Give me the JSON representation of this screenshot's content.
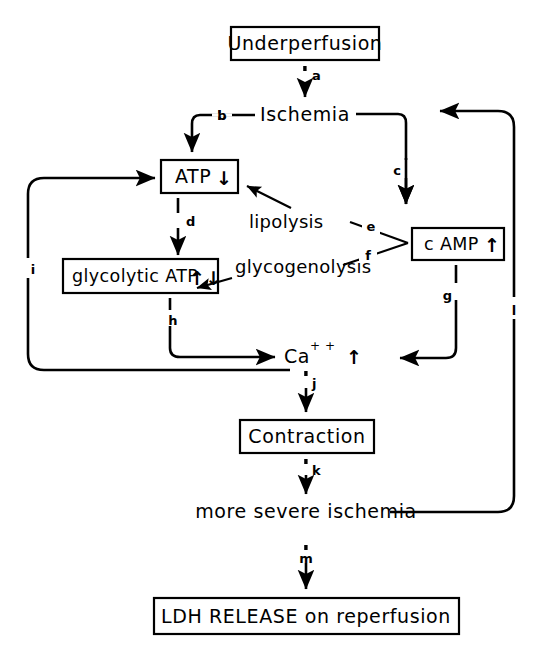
{
  "figure": {
    "type": "flow-diagram",
    "title_visible": false,
    "background_color": "#ffffff",
    "stroke_color": "#000000"
  },
  "nodes": [
    {
      "id": "underperfusion",
      "label": "Underperfusion",
      "shape": "box"
    },
    {
      "id": "ischemia",
      "label": "Ischemia",
      "shape": "plain"
    },
    {
      "id": "atp",
      "label": "ATP",
      "arrow_glyph": "↓",
      "shape": "box"
    },
    {
      "id": "glycolytic_atp",
      "label": "glycolytic  ATP",
      "arrow_glyph": "↑↓",
      "shape": "box"
    },
    {
      "id": "lipolysis",
      "label": "lipolysis",
      "shape": "plain"
    },
    {
      "id": "glycogenolysis",
      "label": "glycogenolysis",
      "shape": "plain"
    },
    {
      "id": "camp",
      "label": "c AMP",
      "arrow_glyph": "↑",
      "shape": "box"
    },
    {
      "id": "calcium",
      "label": "Ca",
      "superscript": "+ +",
      "arrow_glyph": "↑",
      "shape": "plain"
    },
    {
      "id": "contraction",
      "label": "Contraction",
      "shape": "box"
    },
    {
      "id": "more_severe_ischemia",
      "label": "more severe ischemia",
      "shape": "plain"
    },
    {
      "id": "ldh_release",
      "label": "LDH RELEASE on reperfusion",
      "shape": "box"
    }
  ],
  "edges": [
    {
      "id": "a",
      "label": "a",
      "from": "underperfusion",
      "to": "ischemia"
    },
    {
      "id": "b",
      "label": "b",
      "from": "ischemia",
      "to": "atp"
    },
    {
      "id": "c",
      "label": "c",
      "from": "ischemia",
      "to": "camp"
    },
    {
      "id": "d",
      "label": "d",
      "from": "atp",
      "to": "glycolytic_atp"
    },
    {
      "id": "e",
      "label": "e",
      "from": "camp",
      "to": "lipolysis"
    },
    {
      "id": "f",
      "label": "f",
      "from": "camp",
      "to": "glycogenolysis"
    },
    {
      "id": "g",
      "label": "g",
      "from": "camp",
      "to": "calcium"
    },
    {
      "id": "h",
      "label": "h",
      "from": "glycolytic_atp",
      "to": "calcium"
    },
    {
      "id": "i",
      "label": "i",
      "from": "calcium",
      "to": "atp"
    },
    {
      "id": "j",
      "label": "j",
      "from": "calcium",
      "to": "contraction"
    },
    {
      "id": "k",
      "label": "k",
      "from": "contraction",
      "to": "more_severe_ischemia"
    },
    {
      "id": "l",
      "label": "l",
      "from": "more_severe_ischemia",
      "to": "ischemia"
    },
    {
      "id": "m",
      "label": "m",
      "from": "more_severe_ischemia",
      "to": "ldh_release"
    },
    {
      "id": "lipolysis_to_atp",
      "label": "",
      "from": "lipolysis",
      "to": "atp"
    },
    {
      "id": "glycogenolysis_to_glycolytic",
      "label": "",
      "from": "glycogenolysis",
      "to": "glycolytic_atp"
    }
  ]
}
